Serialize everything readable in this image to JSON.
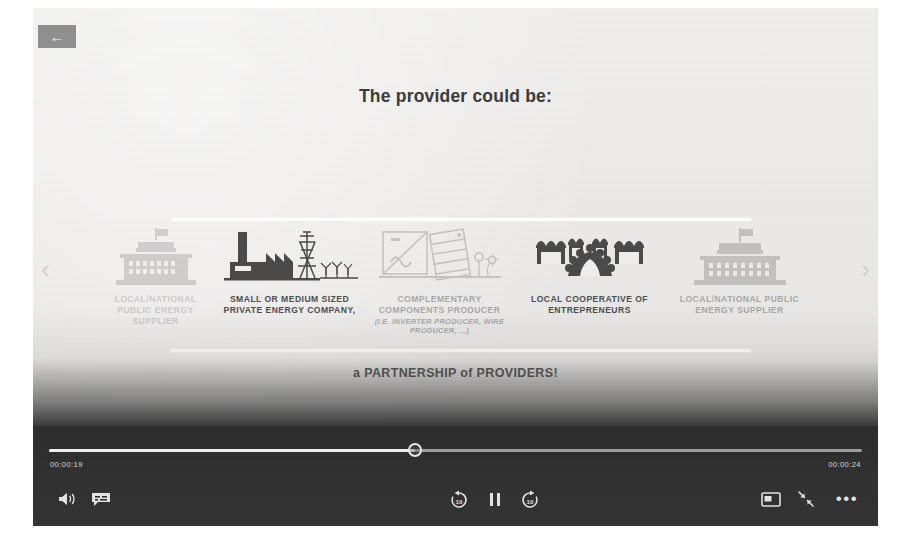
{
  "player": {
    "back_button_icon": "arrow-left-icon",
    "back_button_label": "←"
  },
  "slide": {
    "title": "The provider could be:",
    "partnership_prefix": "a ",
    "partnership_text": "PARTNERSHIP of PROVIDERS!",
    "carousel": {
      "prev_arrow": "‹",
      "next_arrow": "›",
      "items": [
        {
          "id": "public-energy-supplier-offscreen",
          "icon": "government-building-icon",
          "caption": "LOCAL/NATIONAL PUBLIC ENERGY SUPPLIER",
          "sub": ""
        },
        {
          "id": "private-energy-company",
          "icon": "factory-powerline-icon",
          "caption": "SMALL OR MEDIUM SIZED PRIVATE ENERGY COMPANY,",
          "sub": ""
        },
        {
          "id": "complementary-components-producer",
          "icon": "solar-panel-inverter-icon",
          "caption": "COMPLEMENTARY COMPONENTS PRODUCER",
          "sub": "(i.e. INVERTER PRODUCER, WIRE PRODUCER, ...)"
        },
        {
          "id": "local-cooperative",
          "icon": "market-stalls-people-icon",
          "caption": "LOCAL COOPERATIVE OF ENTREPRENEURS",
          "sub": ""
        },
        {
          "id": "public-energy-supplier",
          "icon": "government-building-icon",
          "caption": "LOCAL/NATIONAL PUBLIC ENERGY SUPPLIER",
          "sub": ""
        }
      ]
    }
  },
  "controls": {
    "current_time": "00:00:19",
    "duration": "00:00:24",
    "progress_percent": 45,
    "buttons": {
      "volume": "volume-icon",
      "captions": "captions-icon",
      "rewind": "rewind-10-icon",
      "playpause": "pause-icon",
      "forward": "forward-10-icon",
      "pip": "picture-in-picture-icon",
      "fullscreen": "exit-fullscreen-icon",
      "more": "more-options-icon",
      "more_label": "•••"
    }
  },
  "colors": {
    "slide_bg": "#ededec",
    "control_bar": "#303030",
    "text_dark": "#3b3b3b",
    "caption": "#4c4c4c",
    "rule": "#fdfdfd"
  }
}
